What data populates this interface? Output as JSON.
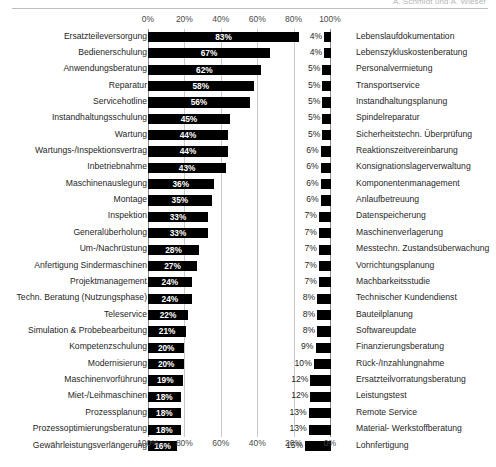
{
  "header": {
    "text": "A. Schmidt und A. Wieser",
    "rule": "horizontal-rule"
  },
  "bottom_caption": {
    "text": ""
  },
  "chart_data": {
    "type": "bar",
    "orientation": "horizontal",
    "title": "",
    "subtitle": "",
    "xlabel": "",
    "ylabel": "",
    "grid": true,
    "legend": "none",
    "panels": [
      {
        "name": "left-panel",
        "axis_position": "top",
        "axis_label_suffix": "%",
        "direction": "left-to-right",
        "xlim": [
          0,
          100
        ],
        "ticks": [
          0,
          20,
          40,
          60,
          80,
          100
        ],
        "tick_labels": [
          "0%",
          "20%",
          "40%",
          "60%",
          "80%",
          "100%"
        ],
        "categories": [
          "Ersatzteileversorgung",
          "Bedienerschulung",
          "Anwendungsberatung",
          "Reparatur",
          "Servicehotline",
          "Instandhaltungsschulung",
          "Wartung",
          "Wartungs-/Inspektionsvertrag",
          "Inbetriebnahme",
          "Maschinenauslegung",
          "Montage",
          "Inspektion",
          "Generalüberholung",
          "Um-/Nachrüstung",
          "Anfertigung Sindermaschinen",
          "Projektmanagement",
          "Techn. Beratung (Nutzungsphase)",
          "Teleservice",
          "Simulation & Probebearbeitung",
          "Kompetenzschulung",
          "Modernisierung",
          "Maschinenvorführung",
          "Miet-/Leihmaschinen",
          "Prozessplanung",
          "Prozessoptimierungsberatung",
          "Gewährleistungsverlängerung"
        ],
        "values": [
          83,
          67,
          62,
          58,
          56,
          45,
          44,
          44,
          43,
          36,
          35,
          33,
          33,
          28,
          27,
          24,
          24,
          22,
          21,
          20,
          20,
          19,
          18,
          18,
          18,
          16
        ],
        "value_labels": [
          "83%",
          "67%",
          "62%",
          "58%",
          "56%",
          "45%",
          "44%",
          "44%",
          "43%",
          "36%",
          "35%",
          "33%",
          "33%",
          "28%",
          "27%",
          "24%",
          "24%",
          "22%",
          "21%",
          "20%",
          "20%",
          "19%",
          "18%",
          "18%",
          "18%",
          "16%"
        ]
      },
      {
        "name": "right-panel",
        "axis_position": "bottom",
        "axis_label_suffix": "%",
        "direction": "left-to-right",
        "xlim": [
          0,
          100
        ],
        "ticks": [
          100,
          80,
          60,
          40,
          20,
          0
        ],
        "tick_labels": [
          "100%",
          "80%",
          "60%",
          "40%",
          "20%",
          "0%"
        ],
        "categories": [
          "Lebenslaufdokumentation",
          "Lebenszykluskostenberatung",
          "Personalvermietung",
          "Transportservice",
          "Instandhaltungsplanung",
          "Spindelreparatur",
          "Sicherheitstechn. Überprüfung",
          "Reaktionszeitvereinbarung",
          "Konsignationslagerverwaltung",
          "Komponentenmanagement",
          "Anlaufbetreuung",
          "Datenspeicherung",
          "Maschinenverlagerung",
          "Messtechn. Zustandsüberwachung",
          "Vorrichtungsplanung",
          "Machbarkeitsstudie",
          "Technischer Kundendienst",
          "Bauteilplanung",
          "Softwareupdate",
          "Finanzierungsberatung",
          "Rück-/Inzahlungnahme",
          "Ersatzteilvorratungsberatung",
          "Leistungstest",
          "Remote Service",
          "Material- Werkstoffberatung",
          "Lohnfertigung"
        ],
        "values": [
          4,
          4,
          5,
          5,
          5,
          5,
          5,
          6,
          6,
          6,
          6,
          7,
          7,
          7,
          7,
          7,
          8,
          8,
          8,
          9,
          10,
          12,
          12,
          13,
          13,
          15
        ],
        "value_labels": [
          "4%",
          "4%",
          "5%",
          "5%",
          "5%",
          "5%",
          "5%",
          "6%",
          "6%",
          "6%",
          "6%",
          "7%",
          "7%",
          "7%",
          "7%",
          "7%",
          "8%",
          "8%",
          "8%",
          "9%",
          "10%",
          "12%",
          "12%",
          "13%",
          "13%",
          "15%"
        ]
      }
    ]
  }
}
